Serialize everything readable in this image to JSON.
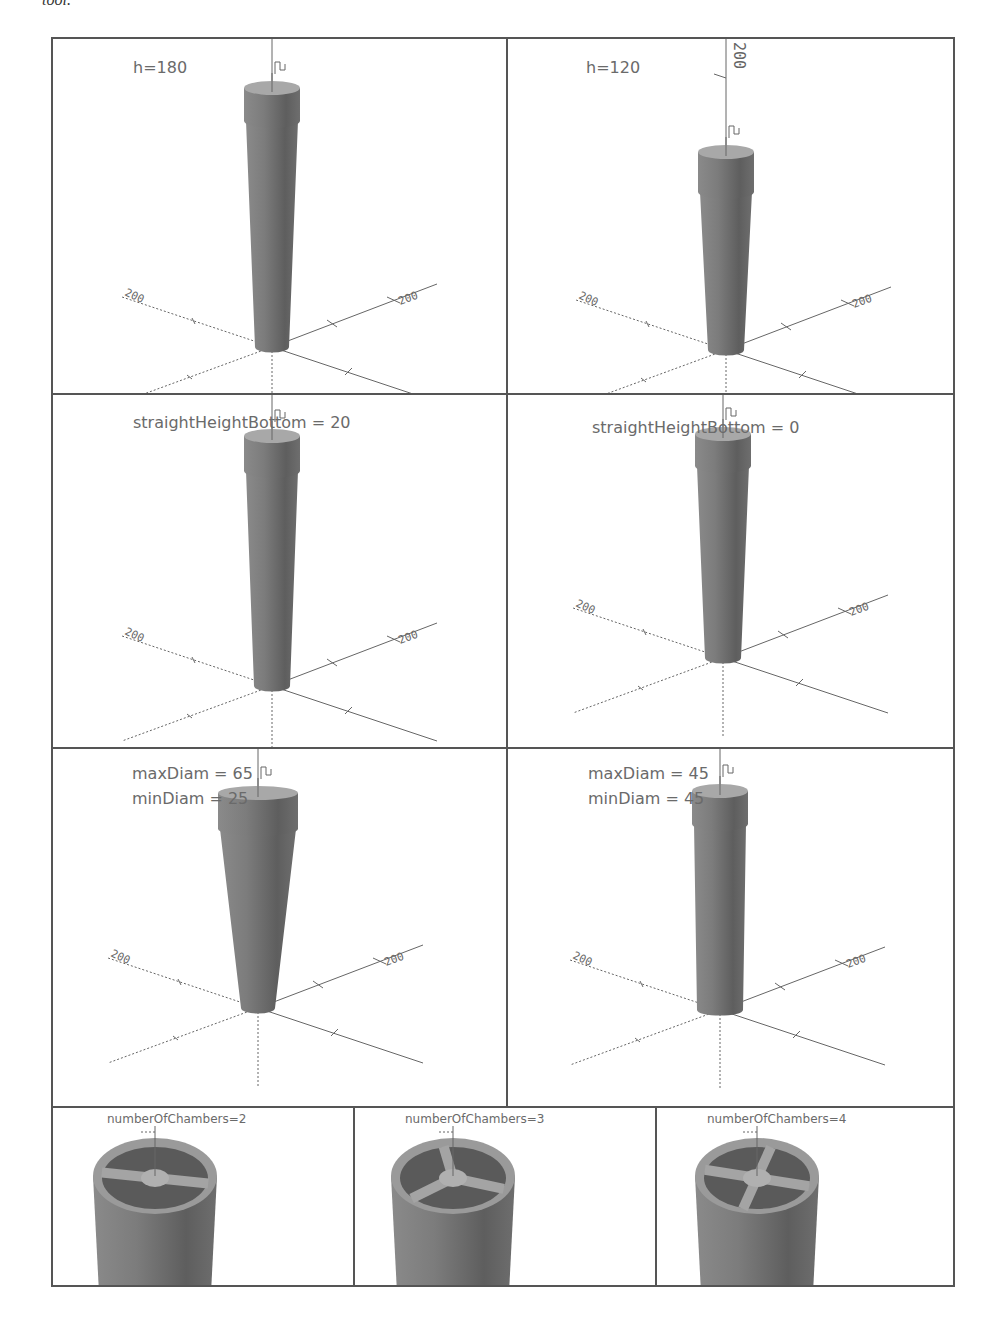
{
  "page": {
    "top_text_fragment": "tool."
  },
  "figure": {
    "colors": {
      "border": "#555555",
      "label_text": "#6a6a6a",
      "model_fill": "#7a7a7a",
      "model_dark": "#555555",
      "model_top": "#a8a8a8",
      "axis": "#666666"
    },
    "panels": [
      {
        "id": "h180",
        "lines": [
          "h=180"
        ],
        "axis_top_label": "",
        "model": {
          "height": 180,
          "maxDiam": 45,
          "minDiam": 35,
          "straightHeightBottom": 20
        }
      },
      {
        "id": "h120",
        "lines": [
          "h=120"
        ],
        "axis_top_label": "200",
        "model": {
          "height": 120,
          "maxDiam": 45,
          "minDiam": 35,
          "straightHeightBottom": 20
        }
      },
      {
        "id": "shb20",
        "lines": [
          "straightHeightBottom = 20"
        ],
        "axis_top_label": "",
        "model": {
          "height": 180,
          "maxDiam": 45,
          "minDiam": 35,
          "straightHeightBottom": 20
        }
      },
      {
        "id": "shb0",
        "lines": [
          "straightHeightBottom = 0"
        ],
        "axis_top_label": "",
        "model": {
          "height": 180,
          "maxDiam": 45,
          "minDiam": 35,
          "straightHeightBottom": 0
        }
      },
      {
        "id": "diam65_25",
        "lines": [
          "maxDiam = 65",
          "minDiam = 25"
        ],
        "axis_top_label": "",
        "model": {
          "height": 180,
          "maxDiam": 65,
          "minDiam": 25
        }
      },
      {
        "id": "diam45_45",
        "lines": [
          "maxDiam = 45",
          "minDiam = 45"
        ],
        "axis_top_label": "",
        "model": {
          "height": 180,
          "maxDiam": 45,
          "minDiam": 45
        }
      }
    ],
    "chamber_panels": [
      {
        "id": "chambers2",
        "label": "numberOfChambers=2",
        "chambers": 2
      },
      {
        "id": "chambers3",
        "label": "numberOfChambers=3",
        "chambers": 3
      },
      {
        "id": "chambers4",
        "label": "numberOfChambers=4",
        "chambers": 4
      }
    ],
    "axis_tick_labels": {
      "x_axis": "200",
      "y_axis": "200",
      "z_axis": "200"
    }
  }
}
